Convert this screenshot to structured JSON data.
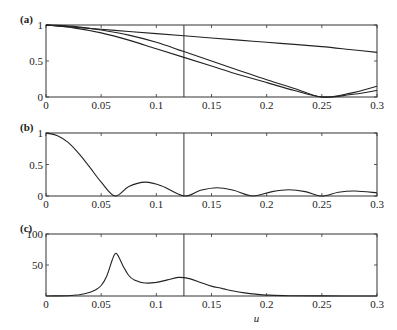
{
  "chart_data": [
    {
      "type": "line",
      "panel_label": "(a)",
      "xlabel": "",
      "ylabel": "",
      "xlim": [
        0,
        0.3
      ],
      "ylim": [
        0,
        1
      ],
      "xticks": [
        "0",
        "0.05",
        "0.1",
        "0.15",
        "0.2",
        "0.25",
        "0.3"
      ],
      "yticks": [
        "0",
        "0.5",
        "1"
      ],
      "vline_x": 0.125,
      "x": [
        0,
        0.025,
        0.05,
        0.075,
        0.1,
        0.125,
        0.15,
        0.175,
        0.2,
        0.225,
        0.25,
        0.275,
        0.3
      ],
      "series": [
        {
          "name": "upper",
          "values": [
            1.0,
            0.97,
            0.94,
            0.91,
            0.88,
            0.85,
            0.82,
            0.79,
            0.76,
            0.73,
            0.7,
            0.66,
            0.62
          ]
        },
        {
          "name": "middle",
          "values": [
            1.0,
            0.98,
            0.93,
            0.86,
            0.76,
            0.63,
            0.5,
            0.37,
            0.24,
            0.12,
            0.0,
            0.05,
            0.15
          ]
        },
        {
          "name": "lower",
          "values": [
            1.0,
            0.96,
            0.89,
            0.79,
            0.67,
            0.55,
            0.43,
            0.31,
            0.2,
            0.09,
            0.0,
            0.03,
            0.09
          ]
        }
      ]
    },
    {
      "type": "line",
      "panel_label": "(b)",
      "xlabel": "",
      "ylabel": "",
      "xlim": [
        0,
        0.3
      ],
      "ylim": [
        0,
        1
      ],
      "xticks": [
        "0",
        "0.05",
        "0.1",
        "0.15",
        "0.2",
        "0.25",
        "0.3"
      ],
      "yticks": [
        "0",
        "0.5",
        "1"
      ],
      "vline_x": 0.125,
      "x": [
        0,
        0.01,
        0.02,
        0.03,
        0.04,
        0.05,
        0.0625,
        0.075,
        0.09,
        0.105,
        0.125,
        0.14,
        0.155,
        0.17,
        0.1875,
        0.205,
        0.22,
        0.235,
        0.25,
        0.265,
        0.28,
        0.3
      ],
      "series": [
        {
          "name": "response",
          "values": [
            1.0,
            0.96,
            0.85,
            0.67,
            0.45,
            0.22,
            0.0,
            0.15,
            0.22,
            0.16,
            0.0,
            0.09,
            0.13,
            0.09,
            0.0,
            0.07,
            0.1,
            0.07,
            0.0,
            0.06,
            0.08,
            0.05
          ]
        }
      ]
    },
    {
      "type": "line",
      "panel_label": "(c)",
      "xlabel": "u",
      "ylabel": "",
      "xlim": [
        0,
        0.3
      ],
      "ylim": [
        0,
        100
      ],
      "xticks": [
        "0",
        "0.05",
        "0.1",
        "0.15",
        "0.2",
        "0.25",
        "0.3"
      ],
      "yticks": [
        "50",
        "100"
      ],
      "vline_x": 0.125,
      "x": [
        0,
        0.02,
        0.03,
        0.04,
        0.045,
        0.05,
        0.055,
        0.06,
        0.0625,
        0.065,
        0.07,
        0.075,
        0.08,
        0.09,
        0.1,
        0.11,
        0.12,
        0.13,
        0.14,
        0.15,
        0.16,
        0.17,
        0.18,
        0.19,
        0.2,
        0.22,
        0.25,
        0.3
      ],
      "series": [
        {
          "name": "amplitude",
          "values": [
            0,
            0.5,
            2,
            6,
            10,
            17,
            32,
            58,
            68,
            66,
            48,
            33,
            26,
            21,
            22,
            26,
            30,
            28,
            22,
            16,
            12,
            8,
            5,
            3,
            1.5,
            0.5,
            0.2,
            0
          ]
        }
      ]
    }
  ]
}
